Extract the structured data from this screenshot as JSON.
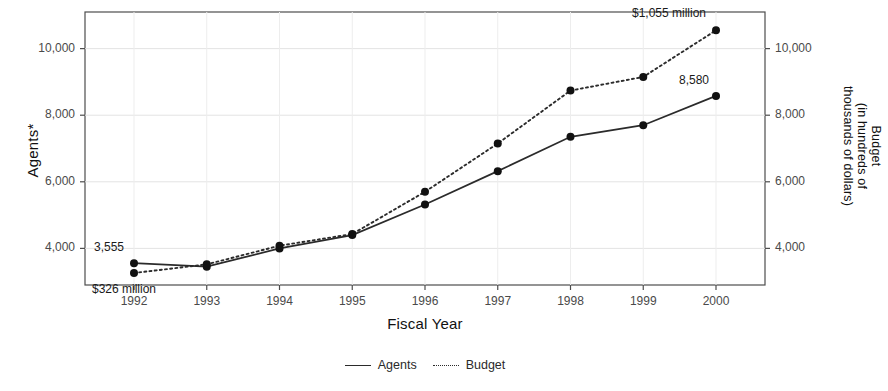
{
  "chart_data": {
    "type": "line",
    "title": "",
    "xlabel": "Fiscal Year",
    "ylabel": "Agents*",
    "ylabel_right_lines": [
      "Budget",
      "(in hundreds of",
      "thousands of dollars)"
    ],
    "categories": [
      "1992",
      "1993",
      "1994",
      "1995",
      "1996",
      "1997",
      "1998",
      "1999",
      "2000"
    ],
    "ylim": [
      2900,
      11100
    ],
    "yticks": [
      4000,
      6000,
      8000,
      10000
    ],
    "ytick_labels": [
      "4,000",
      "6,000",
      "8,000",
      "10,000"
    ],
    "yticks_right": [
      4000,
      6000,
      8000,
      10000
    ],
    "ytick_labels_right": [
      "4,000",
      "6,000",
      "8,000",
      "10,000"
    ],
    "grid": true,
    "legend_position": "bottom",
    "series": [
      {
        "name": "Agents",
        "style": "solid",
        "marker": "filled-circle",
        "values": [
          3555,
          3450,
          4000,
          4400,
          5320,
          6320,
          7350,
          7700,
          8580
        ]
      },
      {
        "name": "Budget",
        "style": "dotted",
        "marker": "filled-circle",
        "values": [
          3260,
          3520,
          4080,
          4430,
          5700,
          7150,
          8740,
          9150,
          10550
        ]
      }
    ],
    "annotations": [
      {
        "text": "3,555",
        "series": "Agents",
        "x": "1992",
        "position": "above"
      },
      {
        "text": "$326 million",
        "series": "Budget",
        "x": "1992",
        "position": "below"
      },
      {
        "text": "8,580",
        "series": "Agents",
        "x": "2000",
        "position": "above"
      },
      {
        "text": "$1,055 million",
        "series": "Budget",
        "x": "2000",
        "position": "above-left"
      }
    ]
  },
  "legend": {
    "agents_label": "Agents",
    "budget_label": "Budget"
  },
  "axis": {
    "x_title": "Fiscal Year",
    "y_left_title": "Agents*",
    "y_right_line1": "Budget",
    "y_right_line2": "(in hundreds of",
    "y_right_line3": "thousands of dollars)"
  },
  "xticks": [
    "1992",
    "1993",
    "1994",
    "1995",
    "1996",
    "1997",
    "1998",
    "1999",
    "2000"
  ],
  "yticks_left": [
    "10,000",
    "8,000",
    "6,000",
    "4,000"
  ],
  "yticks_right": [
    "10,000",
    "8,000",
    "6,000",
    "4,000"
  ],
  "annotations": {
    "start_agents": "3,555",
    "start_budget": "$326 million",
    "end_agents": "8,580",
    "end_budget": "$1,055 million"
  }
}
